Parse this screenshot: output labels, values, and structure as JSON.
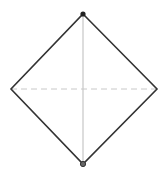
{
  "diagram": {
    "shape": "diamond",
    "vertices": {
      "top": [
        83,
        14
      ],
      "right": [
        157,
        89
      ],
      "bottom": [
        83,
        164
      ],
      "left": [
        11,
        89
      ]
    },
    "colors": {
      "outline": "#333333",
      "vertical_axis": "#bbbbbb",
      "horizontal_axis": "#c8c8c8",
      "top_point": "#222222",
      "bottom_point": "#444444"
    },
    "axes": {
      "vertical": "solid",
      "horizontal": "dashed"
    },
    "points": [
      "top",
      "bottom"
    ]
  }
}
